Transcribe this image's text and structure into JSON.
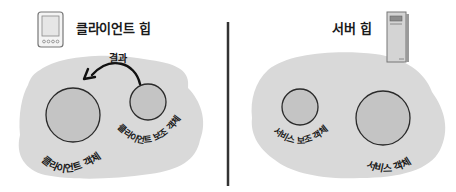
{
  "client_heap": {
    "title": "클라이언트 힙",
    "icon": "pda-device-icon",
    "arrow_label": "결과",
    "objects": [
      {
        "label": "클라이언트 객체",
        "size": "large"
      },
      {
        "label": "클라이언트 보조 객체",
        "size": "small"
      }
    ]
  },
  "server_heap": {
    "title": "서버 힙",
    "icon": "server-tower-icon",
    "objects": [
      {
        "label": "서비스 보조 객체",
        "size": "small"
      },
      {
        "label": "서비스 객체",
        "size": "large"
      }
    ]
  },
  "colors": {
    "heap_fill": "#d9d9d9",
    "object_fill": "#c4c4c4",
    "object_stroke": "#2a2a2a",
    "divider": "#333333",
    "text": "#1a1a1a"
  }
}
